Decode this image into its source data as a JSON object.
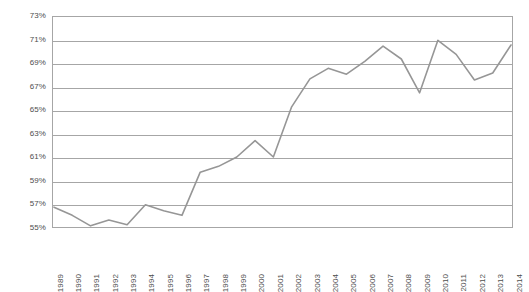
{
  "chart_data": {
    "type": "line",
    "title": "",
    "subtitle": "",
    "xlabel": "",
    "ylabel": "",
    "ylim": [
      55,
      73
    ],
    "ytick_step": 2,
    "grid": true,
    "legend": null,
    "legend_position": "none",
    "y_tick_labels": [
      "73%",
      "71%",
      "69%",
      "67%",
      "65%",
      "63%",
      "61%",
      "59%",
      "57%",
      "55%"
    ],
    "y_tick_values": [
      73,
      71,
      69,
      67,
      65,
      63,
      61,
      59,
      57,
      55
    ],
    "x": [
      "1989",
      "1990",
      "1991",
      "1992",
      "1993",
      "1994",
      "1995",
      "1996",
      "1997",
      "1998",
      "1999",
      "2000",
      "2001",
      "2002",
      "2003",
      "2004",
      "2005",
      "2006",
      "2007",
      "2008",
      "2009",
      "2010",
      "2011",
      "2012",
      "2013",
      "2014"
    ],
    "categories": [
      "1989",
      "1990",
      "1991",
      "1992",
      "1993",
      "1994",
      "1995",
      "1996",
      "1997",
      "1998",
      "1999",
      "2000",
      "2001",
      "2002",
      "2003",
      "2004",
      "2005",
      "2006",
      "2007",
      "2008",
      "2009",
      "2010",
      "2011",
      "2012",
      "2013",
      "2014"
    ],
    "values": [
      56.7,
      56.0,
      55.1,
      55.6,
      55.2,
      56.9,
      56.4,
      56.0,
      59.7,
      60.2,
      61.0,
      62.4,
      61.0,
      65.3,
      67.7,
      68.6,
      68.1,
      69.2,
      70.5,
      69.4,
      66.5,
      71.0,
      69.8,
      67.6,
      68.2,
      70.6
    ],
    "series": [
      {
        "name": "series-1",
        "color": "#969696",
        "values": [
          56.7,
          56.0,
          55.1,
          55.6,
          55.2,
          56.9,
          56.4,
          56.0,
          59.7,
          60.2,
          61.0,
          62.4,
          61.0,
          65.3,
          67.7,
          68.6,
          68.1,
          69.2,
          70.5,
          69.4,
          66.5,
          71.0,
          69.8,
          67.6,
          68.2,
          70.6
        ]
      }
    ],
    "annotations": [],
    "colors": {
      "line": "#969696",
      "gridline": "#a6a6a6",
      "frame": "#a6a6a6",
      "tick_text": "#4d4d4d",
      "plot_background": "#ffffff"
    }
  }
}
